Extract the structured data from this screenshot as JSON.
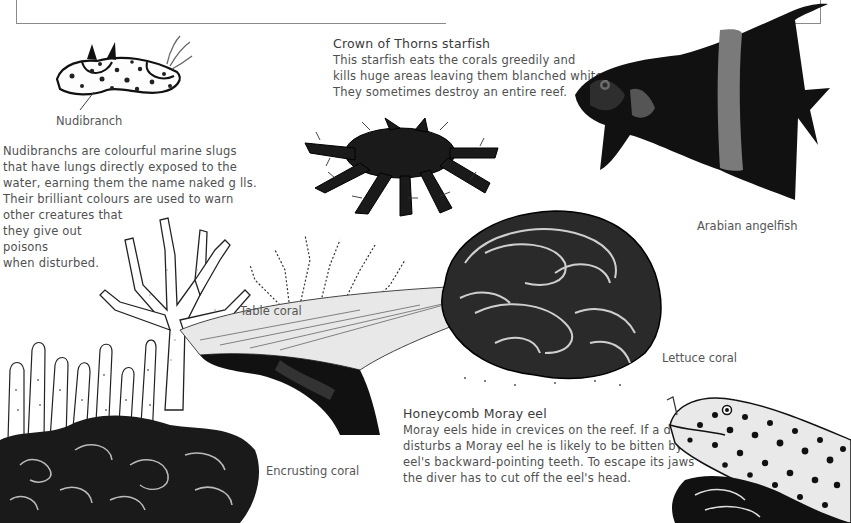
{
  "page": {
    "frame_color": "#8a8a8a",
    "ink_color": "#111111"
  },
  "nudibranch": {
    "label": "Nudibranch",
    "description_lines": [
      "Nudibranchs are colourful marine slugs",
      "that have lungs directly exposed to the",
      "water, earning them the name naked g lls.",
      "Their brilliant colours are used to warn",
      "other creatures that",
      "they give out",
      "poisons",
      "when disturbed."
    ]
  },
  "starfish": {
    "title": "Crown of Thorns starfish",
    "description_lines": [
      "This starfish eats the corals greedily and",
      "kills huge areas leaving them blanched white.",
      "They sometimes destroy an entire reef."
    ]
  },
  "angelfish": {
    "label": "Arabian angelfish"
  },
  "corals": {
    "table_label": "Table coral",
    "lettuce_label": "Lettuce coral",
    "encrusting_label": "Encrusting coral"
  },
  "eel": {
    "title": "Honeycomb Moray eel",
    "description_lines": [
      "Moray eels hide in crevices on the reef. If a diver",
      "disturbs a Moray eel he is likely to be bitten by the",
      "eel's backward-pointing teeth. To escape its jaws",
      "the diver has to cut off the eel's head."
    ]
  }
}
